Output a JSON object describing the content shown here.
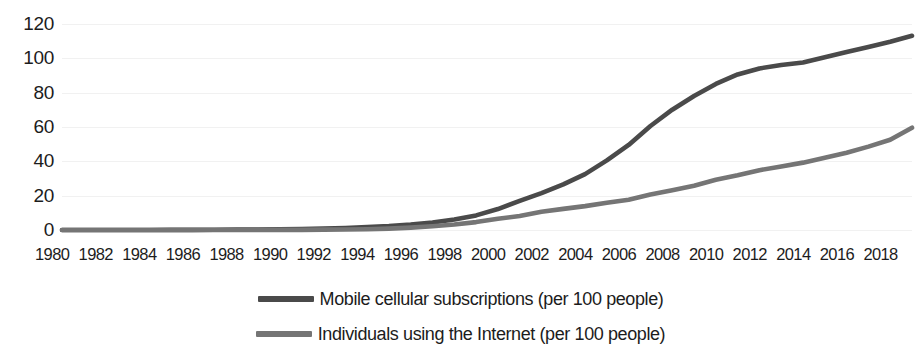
{
  "chart_data": {
    "type": "line",
    "title": "",
    "xlabel": "",
    "ylabel": "",
    "xlim": [
      1980,
      2019
    ],
    "ylim": [
      0,
      128
    ],
    "grid": true,
    "legend_position": "bottom",
    "x_tick_labels": [
      "1980",
      "1982",
      "1984",
      "1986",
      "1988",
      "1990",
      "1992",
      "1994",
      "1996",
      "1998",
      "2000",
      "2002",
      "2004",
      "2006",
      "2008",
      "2010",
      "2012",
      "2014",
      "2016",
      "2018"
    ],
    "y_tick_labels": [
      "0",
      "20",
      "40",
      "60",
      "80",
      "100",
      "120"
    ],
    "y_ticks": [
      0,
      20,
      40,
      60,
      80,
      100,
      120
    ],
    "x": [
      1980,
      1981,
      1982,
      1983,
      1984,
      1985,
      1986,
      1987,
      1988,
      1989,
      1990,
      1991,
      1992,
      1993,
      1994,
      1995,
      1996,
      1997,
      1998,
      1999,
      2000,
      2001,
      2002,
      2003,
      2004,
      2005,
      2006,
      2007,
      2008,
      2009,
      2010,
      2011,
      2012,
      2013,
      2014,
      2015,
      2016,
      2017,
      2018,
      2019
    ],
    "series": [
      {
        "name": "Mobile cellular subscriptions (per 100 people)",
        "color": "#4a4a4a",
        "values": [
          0,
          0,
          0,
          0,
          0.02,
          0.05,
          0.1,
          0.15,
          0.2,
          0.3,
          0.45,
          0.6,
          0.9,
          1.2,
          1.7,
          2.3,
          3.2,
          4.4,
          6.1,
          8.5,
          12.2,
          17.0,
          21.5,
          26.5,
          32.5,
          40.5,
          49.5,
          60.5,
          70.0,
          78.0,
          85.0,
          90.5,
          94.0,
          96.0,
          97.5,
          100.5,
          103.5,
          106.5,
          109.5,
          113.0
        ]
      },
      {
        "name": "Individuals using the Internet (per 100 people)",
        "color": "#757575",
        "values": [
          0,
          0,
          0,
          0,
          0,
          0,
          0,
          0,
          0,
          0.02,
          0.05,
          0.1,
          0.2,
          0.3,
          0.45,
          0.8,
          1.4,
          2.2,
          3.2,
          4.6,
          6.5,
          8.1,
          10.6,
          12.3,
          13.9,
          15.8,
          17.6,
          20.6,
          23.1,
          25.8,
          29.2,
          31.8,
          34.8,
          37.0,
          39.2,
          42.0,
          45.0,
          48.5,
          52.5,
          59.5
        ]
      }
    ]
  },
  "legend": {
    "items": [
      {
        "label": "Mobile cellular subscriptions (per 100 people)",
        "color": "#4a4a4a"
      },
      {
        "label": "Individuals using the Internet (per 100 people)",
        "color": "#757575"
      }
    ]
  }
}
